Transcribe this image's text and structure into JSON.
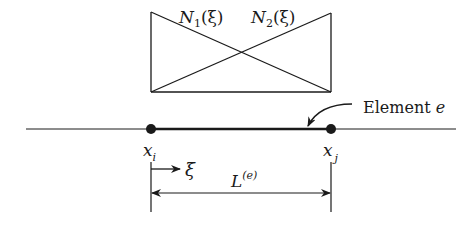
{
  "figure": {
    "type": "1D finite element with linear shape functions",
    "shape_functions": {
      "n1_label": "N",
      "n1_sub": "1",
      "n1_arg": "(ξ)",
      "n2_label": "N",
      "n2_sub": "2",
      "n2_arg": "(ξ)"
    },
    "element": {
      "label_text": "Element ",
      "label_var": "e"
    },
    "nodes": [
      {
        "base": "x",
        "sub": "i"
      },
      {
        "base": "x",
        "sub": "j"
      }
    ],
    "local_coordinate": {
      "label": "ξ"
    },
    "length": {
      "base": "L",
      "sup": "(e)"
    },
    "colors": {
      "ink": "#1a1a1a",
      "background": "#ffffff"
    }
  }
}
